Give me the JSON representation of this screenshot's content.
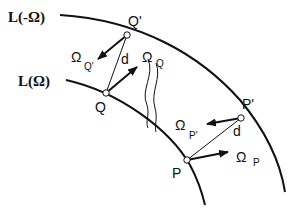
{
  "curves": {
    "outer_label": "L(-Ω)",
    "inner_label": "L(Ω)"
  },
  "points": {
    "Q_prime": "Q'",
    "Q": "Q",
    "P_prime": "P'",
    "P": "P"
  },
  "distances": {
    "d_upper": "d",
    "d_lower": "d"
  },
  "vectors": {
    "omega_symbol": "Ω",
    "Q_prime_sub": "Q'",
    "Q_sub": "Q",
    "P_prime_sub": "P'",
    "P_sub": "P"
  }
}
